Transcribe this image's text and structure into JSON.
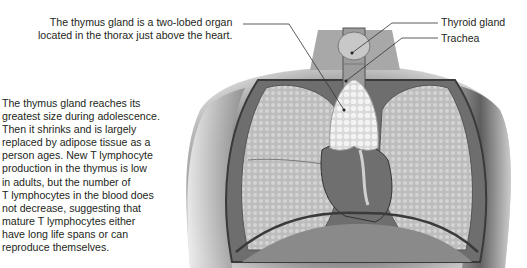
{
  "callouts": {
    "thymus": {
      "line1": "The thymus gland is a two-lobed organ",
      "line2": "located in the thorax just above the heart."
    },
    "thyroid": "Thyroid gland",
    "trachea": "Trachea"
  },
  "side_note": {
    "lines": [
      "The thymus gland reaches its",
      "greatest size during adolescence.",
      "Then it shrinks and is largely",
      "replaced by adipose tissue as a",
      "person ages. New T lymphocyte",
      "production in the thymus is low",
      "in adults, but the number of",
      "T lymphocytes in the blood does",
      "not decrease, suggesting that",
      "mature T lymphocytes either",
      "have long life spans or can",
      "reproduce themselves."
    ]
  },
  "figure": {
    "colors": {
      "skin": "#8e8e8e",
      "lung": "#c9c9c9",
      "thymus": "#ececec",
      "heart": "#6f6f6f",
      "line": "#3a3a3a"
    }
  }
}
